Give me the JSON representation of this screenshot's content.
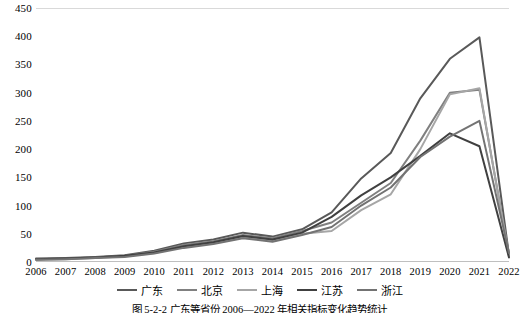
{
  "chart_data": {
    "type": "line",
    "title": "",
    "xlabel": "",
    "ylabel": "",
    "ylim": [
      0,
      450
    ],
    "ytick_step": 50,
    "yticks": [
      0,
      50,
      100,
      150,
      200,
      250,
      300,
      350,
      400,
      450
    ],
    "grid": false,
    "legend_position": "bottom",
    "categories": [
      "2006",
      "2007",
      "2008",
      "2009",
      "2010",
      "2011",
      "2012",
      "2013",
      "2014",
      "2015",
      "2016",
      "2017",
      "2018",
      "2019",
      "2020",
      "2021",
      "2022"
    ],
    "series": [
      {
        "name": "广东",
        "color": "#595959",
        "width": 2.0,
        "values": [
          6,
          7,
          9,
          12,
          20,
          33,
          40,
          52,
          45,
          58,
          88,
          148,
          193,
          290,
          360,
          398,
          12
        ]
      },
      {
        "name": "北京",
        "color": "#808080",
        "width": 2.0,
        "values": [
          5,
          6,
          8,
          11,
          18,
          30,
          37,
          48,
          42,
          55,
          70,
          105,
          140,
          215,
          300,
          305,
          14
        ]
      },
      {
        "name": "上海",
        "color": "#a6a6a6",
        "width": 2.0,
        "values": [
          4,
          5,
          7,
          10,
          16,
          27,
          34,
          44,
          38,
          50,
          55,
          92,
          120,
          200,
          297,
          308,
          10
        ]
      },
      {
        "name": "江苏",
        "color": "#404040",
        "width": 2.0,
        "values": [
          5,
          6,
          8,
          11,
          17,
          28,
          35,
          46,
          40,
          52,
          80,
          118,
          150,
          188,
          228,
          205,
          8
        ]
      },
      {
        "name": "浙江",
        "color": "#737373",
        "width": 2.0,
        "values": [
          4,
          5,
          7,
          9,
          15,
          25,
          32,
          42,
          36,
          48,
          62,
          100,
          132,
          186,
          222,
          250,
          16
        ]
      }
    ]
  },
  "legend": {
    "items": [
      {
        "label": "广东",
        "color": "#595959"
      },
      {
        "label": "北京",
        "color": "#808080"
      },
      {
        "label": "上海",
        "color": "#a6a6a6"
      },
      {
        "label": "江苏",
        "color": "#404040"
      },
      {
        "label": "浙江",
        "color": "#737373"
      }
    ]
  },
  "caption": {
    "text": "图 5-2-2  广东等省份 2006—2022 年相关指标变化趋势统计"
  }
}
